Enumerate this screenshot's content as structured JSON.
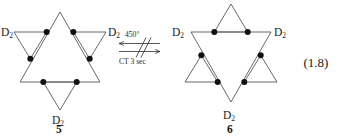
{
  "figure": {
    "equation_number": "(1.8)",
    "type": "chemical-reaction-scheme"
  },
  "reactant": {
    "compound_number": "5",
    "labels": {
      "upper_left": "D",
      "upper_left_sub": "2",
      "upper_right": "D",
      "upper_right_sub": "2",
      "bottom": "D",
      "bottom_sub": "2"
    },
    "vertex_count": "6",
    "shape": "hexagram-upright"
  },
  "product": {
    "compound_number": "6",
    "labels": {
      "upper_left": "D",
      "upper_left_sub": "2",
      "upper_right": "D",
      "upper_right_sub": "2",
      "bottom": "D",
      "bottom_sub": "2"
    },
    "vertex_count": "6",
    "shape": "hexagram-inverted"
  },
  "reaction_arrow": {
    "condition_above": "450",
    "condition_above_unit": "°",
    "condition_below": "CT 3 sec",
    "direction": "equilibrium-double-arrow",
    "slash_count": "2"
  },
  "colors": {
    "line": "#585858",
    "dot": "#111111",
    "text": "#1a1a1a",
    "arrow": "#3a3a3a",
    "background": "#ffffff"
  }
}
